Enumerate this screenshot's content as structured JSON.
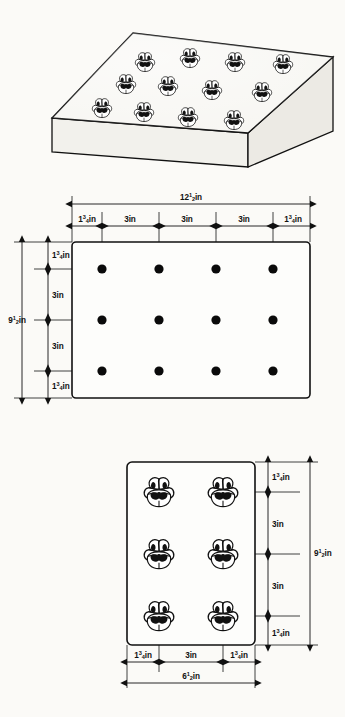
{
  "document": {
    "title": "Pansy Planting Spacing Diagram",
    "unit": "in"
  },
  "figures": {
    "perspective": {
      "name": "Sloped planting bed with pansies",
      "plant_count": 12,
      "rows": 3,
      "columns": 4,
      "plant_label": "pansy"
    },
    "plan": {
      "name": "Plan view spacing grid",
      "rows": 3,
      "columns": 4,
      "dot_count": 12,
      "overall_width_label": "12½in",
      "overall_width_whole": "12",
      "overall_width_frac_num": "1",
      "overall_width_frac_den": "2",
      "overall_height_label": "9½in",
      "overall_height_whole": "9",
      "overall_height_frac_num": "1",
      "overall_height_frac_den": "2",
      "horizontal_chain": [
        {
          "whole": "1",
          "num": "3",
          "den": "4",
          "label": "1¾in"
        },
        {
          "whole": "3",
          "num": "",
          "den": "",
          "label": "3in"
        },
        {
          "whole": "3",
          "num": "",
          "den": "",
          "label": "3in"
        },
        {
          "whole": "3",
          "num": "",
          "den": "",
          "label": "3in"
        },
        {
          "whole": "1",
          "num": "3",
          "den": "4",
          "label": "1¾in"
        }
      ],
      "vertical_chain": [
        {
          "whole": "1",
          "num": "3",
          "den": "4",
          "label": "1¾in"
        },
        {
          "whole": "3",
          "num": "",
          "den": "",
          "label": "3in"
        },
        {
          "whole": "3",
          "num": "",
          "den": "",
          "label": "3in"
        },
        {
          "whole": "1",
          "num": "3",
          "den": "4",
          "label": "1¾in"
        }
      ]
    },
    "detail": {
      "name": "Detail flat of six pansies",
      "rows": 3,
      "columns": 2,
      "plant_count": 6,
      "overall_width_label": "6½in",
      "overall_width_whole": "6",
      "overall_width_frac_num": "1",
      "overall_width_frac_den": "2",
      "overall_height_label": "9½in",
      "overall_height_whole": "9",
      "overall_height_frac_num": "1",
      "overall_height_frac_den": "2",
      "horizontal_chain": [
        {
          "whole": "1",
          "num": "3",
          "den": "4",
          "label": "1¾in"
        },
        {
          "whole": "3",
          "num": "",
          "den": "",
          "label": "3in"
        },
        {
          "whole": "1",
          "num": "3",
          "den": "4",
          "label": "1¾in"
        }
      ],
      "vertical_chain": [
        {
          "whole": "1",
          "num": "3",
          "den": "4",
          "label": "1¾in"
        },
        {
          "whole": "3",
          "num": "",
          "den": "",
          "label": "3in"
        },
        {
          "whole": "3",
          "num": "",
          "den": "",
          "label": "3in"
        },
        {
          "whole": "1",
          "num": "3",
          "den": "4",
          "label": "1¾in"
        }
      ]
    }
  },
  "suffix": {
    "inches": "in"
  },
  "colors": {
    "ink": "#111111",
    "paper": "#fbfaf7",
    "dot": "#0a0a0a"
  }
}
